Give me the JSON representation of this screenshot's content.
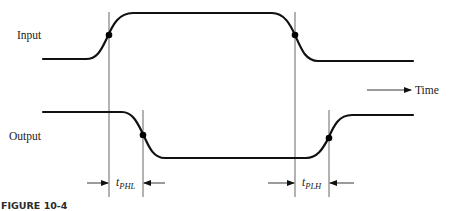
{
  "figure": {
    "caption": "FIGURE 10-4",
    "signals": [
      {
        "name": "input",
        "label": "Input"
      },
      {
        "name": "output",
        "label": "Output"
      }
    ],
    "time_axis_label": "Time",
    "intervals": [
      {
        "name": "t-phl",
        "symbol": "t",
        "subscript": "PHL"
      },
      {
        "name": "t-plh",
        "symbol": "t",
        "subscript": "PLH"
      }
    ]
  }
}
